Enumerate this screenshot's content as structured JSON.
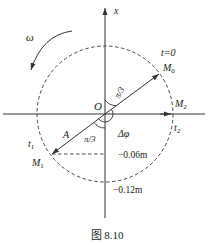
{
  "figure": {
    "caption": "图 8.10",
    "axis_label_x": "x",
    "origin_label": "O",
    "omega_label": "ω",
    "t0_label": "t=0",
    "angle_label_top": "π/3",
    "angle_label_bottom": "π/3",
    "delta_phi_label": "Δφ",
    "amplitude_label": "A",
    "t1_label": "t",
    "t1_sub": "1",
    "t2_label": "t",
    "t2_sub": "2",
    "m0_label": "M",
    "m0_sub": "0",
    "m1_label": "M",
    "m1_sub": "1",
    "m2_label": "M",
    "m2_sub": "2",
    "tick_neg006": "−0.06m",
    "tick_neg012": "−0.12m"
  },
  "colors": {
    "line": "#333333",
    "text": "#222222",
    "background": "#ffffff"
  }
}
